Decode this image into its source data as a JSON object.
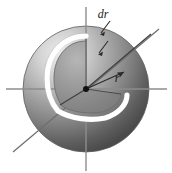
{
  "figure": {
    "canvas": {
      "width": 172,
      "height": 173,
      "background": "#ffffff"
    },
    "center": {
      "x": 86,
      "y": 89
    },
    "sphere": {
      "radius": 63,
      "highlight_color": "#e8e8e8",
      "midtone_color": "#9a9a9a",
      "shadow_color": "#4e4e4e",
      "outline_color": "#5a5a5a",
      "highlight_origin": {
        "x": 0.3,
        "y": 0.22
      }
    },
    "shell": {
      "label": "dr",
      "outline_color": "#ffffff",
      "outline_width": 5,
      "inner_face_color": "#8d8d8d",
      "inner_face_edge": "#6f6f6f",
      "radius_outer": 47,
      "radius_inner": 42
    },
    "radius_arrow": {
      "label": "r",
      "color": "#2b2b2b",
      "from": {
        "x": 86,
        "y": 89
      },
      "to": {
        "x": 126,
        "y": 71
      }
    },
    "dr_leaders": [
      {
        "from": {
          "x": 109,
          "y": 20
        },
        "to": {
          "x": 101,
          "y": 32
        }
      },
      {
        "from": {
          "x": 108,
          "y": 40
        },
        "to": {
          "x": 99,
          "y": 52
        }
      }
    ],
    "axes": [
      {
        "name": "vertical-axis",
        "x1": 86,
        "y1": 7,
        "x2": 86,
        "y2": 171,
        "color": "#8a8a8a"
      },
      {
        "name": "horizontal-axis",
        "x1": 6,
        "y1": 89,
        "x2": 167,
        "y2": 89,
        "color": "#8a8a8a"
      },
      {
        "name": "diagonal-axis",
        "x1": 13,
        "y1": 152,
        "x2": 159,
        "y2": 29,
        "color": "#6e6e6e"
      }
    ],
    "center_dot": {
      "radius": 3,
      "color": "#111111",
      "name": "origin-point"
    },
    "labels": {
      "dr": "dr",
      "r": "r"
    }
  }
}
